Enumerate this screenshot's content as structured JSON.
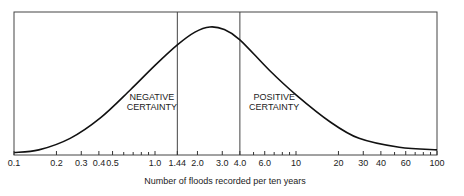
{
  "chart_data": {
    "type": "line",
    "title": "",
    "xlabel": "Number of floods recorded per ten years",
    "ylabel": "",
    "xscale": "log",
    "xlim": [
      0.1,
      100
    ],
    "ylim": [
      0,
      1
    ],
    "grid": false,
    "x_ticks": [
      {
        "value": 0.1,
        "label": "0.1"
      },
      {
        "value": 0.2,
        "label": "0.2"
      },
      {
        "value": 0.3,
        "label": "0.3"
      },
      {
        "value": 0.4,
        "label": "0.4"
      },
      {
        "value": 0.5,
        "label": "0.5"
      },
      {
        "value": 1.0,
        "label": "1.0"
      },
      {
        "value": 1.44,
        "label": "1.44"
      },
      {
        "value": 2.0,
        "label": "2.0"
      },
      {
        "value": 3.0,
        "label": "3.0"
      },
      {
        "value": 4.0,
        "label": "4.0"
      },
      {
        "value": 6.0,
        "label": "6.0"
      },
      {
        "value": 10,
        "label": "10"
      },
      {
        "value": 20,
        "label": "20"
      },
      {
        "value": 30,
        "label": "30"
      },
      {
        "value": 40,
        "label": "40"
      },
      {
        "value": 60,
        "label": "60"
      },
      {
        "value": 100,
        "label": "100"
      }
    ],
    "minor_ticks": [
      0.6,
      0.7,
      0.8,
      0.9,
      5,
      7,
      8,
      9,
      50,
      70,
      80,
      90
    ],
    "series": [
      {
        "name": "flood frequency distribution",
        "x": [
          0.1,
          0.15,
          0.25,
          0.41,
          0.67,
          1.0,
          1.44,
          1.92,
          2.45,
          3.1,
          4.0,
          6.5,
          10,
          17.4,
          28,
          54,
          100
        ],
        "y": [
          0.02,
          0.04,
          0.13,
          0.29,
          0.51,
          0.7,
          0.86,
          0.96,
          1.0,
          0.98,
          0.9,
          0.66,
          0.47,
          0.26,
          0.13,
          0.06,
          0.04
        ]
      }
    ],
    "vertical_lines": [
      {
        "value": 1.44
      },
      {
        "value": 4.0
      }
    ],
    "annotations": [
      {
        "text_line1": "NEGATIVE",
        "text_line2": "CERTAINTY",
        "x": 0.95,
        "y": 0.43
      },
      {
        "text_line1": "POSITIVE",
        "text_line2": "CERTAINTY",
        "x": 7.0,
        "y": 0.43
      }
    ]
  }
}
